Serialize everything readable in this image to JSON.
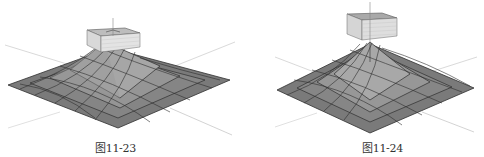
{
  "figures": [
    {
      "id": "left",
      "caption": "图11-23",
      "description": "3D mesh terrain surface with box intersecting the peak"
    },
    {
      "id": "right",
      "caption": "图11-24",
      "description": "3D mesh terrain surface with box floating above the peak"
    }
  ],
  "colors": {
    "surface_dark": "#6e6e6e",
    "surface_mid": "#8c8c8c",
    "surface_light": "#a8a8a8",
    "grid_line": "#2e2e2e",
    "box_top": "#b8b8b8",
    "box_side": "#dcdcdc",
    "axis_line": "#c8c8c8"
  }
}
